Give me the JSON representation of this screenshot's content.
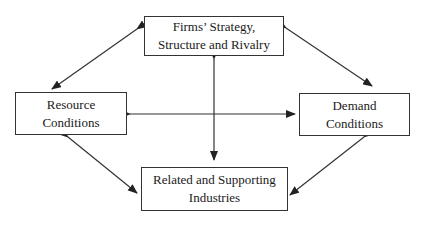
{
  "diagram": {
    "type": "porter-diamond",
    "nodes": {
      "top": {
        "line1": "Firms’ Strategy,",
        "line2": "Structure and Rivalry"
      },
      "left": {
        "line1": "Resource",
        "line2": "Conditions"
      },
      "right": {
        "line1": "Demand",
        "line2": "Conditions"
      },
      "bottom": {
        "line1": "Related and Supporting",
        "line2": "Industries"
      }
    },
    "edges": [
      {
        "from": "top",
        "to": "left",
        "bidirectional": true
      },
      {
        "from": "top",
        "to": "right",
        "bidirectional": true
      },
      {
        "from": "bottom",
        "to": "left",
        "bidirectional": true
      },
      {
        "from": "bottom",
        "to": "right",
        "bidirectional": true
      },
      {
        "from": "left",
        "to": "right",
        "bidirectional": true
      },
      {
        "from": "top",
        "to": "bottom",
        "bidirectional": true
      }
    ],
    "colors": {
      "line": "#333333",
      "text": "#1a1a1a",
      "background": "#ffffff"
    }
  }
}
